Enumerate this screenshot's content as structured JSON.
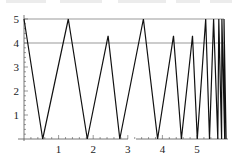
{
  "chart_data": {
    "type": "line",
    "title": "",
    "xlabel": "",
    "ylabel": "",
    "xlim": [
      0,
      5.9
    ],
    "ylim": [
      0,
      5.2
    ],
    "x_ticks": [
      "1",
      "2",
      "3",
      "4",
      "5"
    ],
    "x_tick_values": [
      1,
      2,
      3,
      4,
      5
    ],
    "y_ticks": [
      "1",
      "2",
      "3",
      "4",
      "5"
    ],
    "y_tick_values": [
      1,
      2,
      3,
      4,
      5
    ],
    "reference_lines": [
      {
        "y": 5,
        "color": "#999999"
      },
      {
        "y": 4,
        "color": "#999999"
      }
    ],
    "grid": false,
    "legend": null,
    "series": [
      {
        "name": "zigzag",
        "color": "#111111",
        "x": [
          0,
          0.54,
          1.28,
          1.83,
          2.43,
          2.77,
          3.45,
          3.86,
          4.32,
          4.55,
          4.87,
          5.01,
          5.25,
          5.36,
          5.48,
          5.6,
          5.63,
          5.71,
          5.72,
          5.8,
          5.78,
          5.84
        ],
        "y": [
          5,
          0,
          5,
          0,
          4.3,
          0,
          5,
          0,
          4.3,
          0,
          4.3,
          0,
          5,
          0,
          5,
          0,
          5,
          0,
          5,
          0,
          5,
          0
        ]
      }
    ]
  }
}
